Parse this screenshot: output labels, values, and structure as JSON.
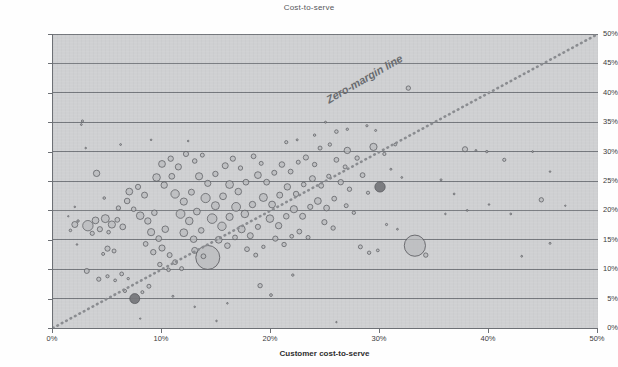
{
  "chart_data": {
    "type": "scatter",
    "title": "Cost-to-serve",
    "xlabel": "Customer cost-to-serve",
    "ylabel": "Product mix margin",
    "xlim": [
      0,
      50
    ],
    "ylim": [
      0,
      50
    ],
    "x_tick_labels": [
      "0%",
      "10%",
      "20%",
      "30%",
      "40%",
      "50%"
    ],
    "x_tick_values": [
      0,
      10,
      20,
      30,
      40,
      50
    ],
    "y_tick_labels": [
      "0%",
      "5%",
      "10%",
      "15%",
      "20%",
      "25%",
      "30%",
      "35%",
      "40%",
      "45%",
      "50%"
    ],
    "y_tick_values": [
      0,
      5,
      10,
      15,
      20,
      25,
      30,
      35,
      40,
      45,
      50
    ],
    "grid": "horizontal",
    "legend": "none",
    "plot_background": "#cfd0d2",
    "bubble_fill": "#b9babd",
    "bubble_stroke": "#55565a",
    "highlight_fill": "#76777b",
    "gridline_color": "#76797e",
    "annotations": [
      {
        "text": "Zero-margin line",
        "type": "reference-line",
        "line_from": [
          0,
          0
        ],
        "line_to": [
          50,
          50
        ],
        "style": "dotted",
        "color": "#8a8c90"
      }
    ],
    "bubbles": [
      {
        "x": 2.0,
        "y": 17.6,
        "r": 3.0
      },
      {
        "x": 2.3,
        "y": 18.2,
        "r": 1.2
      },
      {
        "x": 1.6,
        "y": 16.6,
        "r": 1.3
      },
      {
        "x": 2.7,
        "y": 35.2,
        "r": 1.1
      },
      {
        "x": 2.6,
        "y": 34.6,
        "r": 0.9
      },
      {
        "x": 3.2,
        "y": 17.4,
        "r": 5.2
      },
      {
        "x": 3.9,
        "y": 18.3,
        "r": 3.4
      },
      {
        "x": 4.3,
        "y": 16.8,
        "r": 2.6
      },
      {
        "x": 3.6,
        "y": 16.1,
        "r": 2.1
      },
      {
        "x": 4.8,
        "y": 18.6,
        "r": 4.0
      },
      {
        "x": 5.4,
        "y": 17.6,
        "r": 3.6
      },
      {
        "x": 5.9,
        "y": 18.4,
        "r": 2.4
      },
      {
        "x": 6.4,
        "y": 17.2,
        "r": 2.9
      },
      {
        "x": 5.1,
        "y": 16.3,
        "r": 1.8
      },
      {
        "x": 4.0,
        "y": 26.3,
        "r": 3.2
      },
      {
        "x": 4.7,
        "y": 22.1,
        "r": 1.3
      },
      {
        "x": 5.0,
        "y": 13.5,
        "r": 2.6
      },
      {
        "x": 5.6,
        "y": 13.1,
        "r": 2.0
      },
      {
        "x": 4.6,
        "y": 12.6,
        "r": 1.5
      },
      {
        "x": 3.1,
        "y": 9.7,
        "r": 2.5
      },
      {
        "x": 4.2,
        "y": 8.3,
        "r": 2.1
      },
      {
        "x": 5.0,
        "y": 8.8,
        "r": 1.6
      },
      {
        "x": 5.7,
        "y": 8.1,
        "r": 1.4
      },
      {
        "x": 6.3,
        "y": 9.2,
        "r": 1.9
      },
      {
        "x": 6.9,
        "y": 8.4,
        "r": 1.2
      },
      {
        "x": 7.5,
        "y": 5.0,
        "r": 5.0,
        "highlight": true
      },
      {
        "x": 6.6,
        "y": 6.3,
        "r": 1.6
      },
      {
        "x": 8.2,
        "y": 6.1,
        "r": 1.5
      },
      {
        "x": 8.8,
        "y": 7.1,
        "r": 2.0
      },
      {
        "x": 6.0,
        "y": 20.4,
        "r": 2.2
      },
      {
        "x": 6.8,
        "y": 21.6,
        "r": 2.8
      },
      {
        "x": 7.4,
        "y": 20.2,
        "r": 2.3
      },
      {
        "x": 7.0,
        "y": 23.2,
        "r": 3.4
      },
      {
        "x": 7.8,
        "y": 24.0,
        "r": 2.6
      },
      {
        "x": 8.4,
        "y": 22.6,
        "r": 3.0
      },
      {
        "x": 8.0,
        "y": 19.1,
        "r": 3.8
      },
      {
        "x": 8.7,
        "y": 18.2,
        "r": 3.2
      },
      {
        "x": 9.3,
        "y": 19.6,
        "r": 2.8
      },
      {
        "x": 9.0,
        "y": 16.3,
        "r": 3.6
      },
      {
        "x": 9.7,
        "y": 15.2,
        "r": 2.9
      },
      {
        "x": 10.3,
        "y": 16.8,
        "r": 3.3
      },
      {
        "x": 8.5,
        "y": 14.3,
        "r": 2.4
      },
      {
        "x": 9.2,
        "y": 12.9,
        "r": 2.7
      },
      {
        "x": 10.0,
        "y": 13.6,
        "r": 3.1
      },
      {
        "x": 10.7,
        "y": 12.4,
        "r": 2.5
      },
      {
        "x": 9.8,
        "y": 10.8,
        "r": 2.2
      },
      {
        "x": 10.6,
        "y": 9.9,
        "r": 1.8
      },
      {
        "x": 11.2,
        "y": 11.2,
        "r": 2.4
      },
      {
        "x": 11.8,
        "y": 10.1,
        "r": 2.0
      },
      {
        "x": 9.5,
        "y": 25.6,
        "r": 3.8
      },
      {
        "x": 10.2,
        "y": 24.3,
        "r": 3.2
      },
      {
        "x": 10.9,
        "y": 25.8,
        "r": 2.9
      },
      {
        "x": 10.0,
        "y": 27.9,
        "r": 3.4
      },
      {
        "x": 10.8,
        "y": 28.8,
        "r": 2.7
      },
      {
        "x": 11.5,
        "y": 27.4,
        "r": 3.1
      },
      {
        "x": 11.2,
        "y": 22.8,
        "r": 4.2
      },
      {
        "x": 12.0,
        "y": 21.5,
        "r": 3.6
      },
      {
        "x": 12.7,
        "y": 23.1,
        "r": 3.0
      },
      {
        "x": 11.7,
        "y": 19.4,
        "r": 4.4
      },
      {
        "x": 12.5,
        "y": 18.2,
        "r": 3.8
      },
      {
        "x": 13.2,
        "y": 19.8,
        "r": 3.4
      },
      {
        "x": 12.0,
        "y": 16.2,
        "r": 3.9
      },
      {
        "x": 12.9,
        "y": 15.1,
        "r": 3.3
      },
      {
        "x": 13.6,
        "y": 16.6,
        "r": 2.8
      },
      {
        "x": 13.0,
        "y": 13.2,
        "r": 3.0
      },
      {
        "x": 13.8,
        "y": 12.2,
        "r": 2.4
      },
      {
        "x": 14.2,
        "y": 12.0,
        "r": 12.0
      },
      {
        "x": 12.2,
        "y": 29.6,
        "r": 2.6
      },
      {
        "x": 13.0,
        "y": 28.4,
        "r": 2.3
      },
      {
        "x": 13.7,
        "y": 29.4,
        "r": 2.0
      },
      {
        "x": 13.4,
        "y": 25.8,
        "r": 3.6
      },
      {
        "x": 14.2,
        "y": 24.6,
        "r": 3.1
      },
      {
        "x": 14.9,
        "y": 26.2,
        "r": 2.7
      },
      {
        "x": 14.0,
        "y": 22.1,
        "r": 4.6
      },
      {
        "x": 14.9,
        "y": 20.8,
        "r": 4.0
      },
      {
        "x": 15.6,
        "y": 22.4,
        "r": 3.4
      },
      {
        "x": 14.6,
        "y": 18.6,
        "r": 4.8
      },
      {
        "x": 15.5,
        "y": 17.3,
        "r": 4.2
      },
      {
        "x": 16.2,
        "y": 18.9,
        "r": 3.6
      },
      {
        "x": 15.2,
        "y": 15.0,
        "r": 3.4
      },
      {
        "x": 16.0,
        "y": 14.0,
        "r": 2.8
      },
      {
        "x": 16.7,
        "y": 15.4,
        "r": 2.4
      },
      {
        "x": 15.8,
        "y": 27.6,
        "r": 3.0
      },
      {
        "x": 16.5,
        "y": 28.8,
        "r": 2.6
      },
      {
        "x": 17.2,
        "y": 27.2,
        "r": 2.2
      },
      {
        "x": 16.2,
        "y": 24.4,
        "r": 3.9
      },
      {
        "x": 17.0,
        "y": 23.2,
        "r": 3.3
      },
      {
        "x": 17.7,
        "y": 24.8,
        "r": 2.9
      },
      {
        "x": 16.8,
        "y": 20.6,
        "r": 4.4
      },
      {
        "x": 17.6,
        "y": 19.4,
        "r": 3.8
      },
      {
        "x": 18.3,
        "y": 21.0,
        "r": 3.2
      },
      {
        "x": 17.3,
        "y": 16.8,
        "r": 3.6
      },
      {
        "x": 18.1,
        "y": 15.7,
        "r": 3.0
      },
      {
        "x": 18.8,
        "y": 17.2,
        "r": 2.6
      },
      {
        "x": 17.8,
        "y": 13.4,
        "r": 2.4
      },
      {
        "x": 18.6,
        "y": 12.4,
        "r": 2.0
      },
      {
        "x": 19.3,
        "y": 13.8,
        "r": 1.7
      },
      {
        "x": 18.4,
        "y": 29.2,
        "r": 2.4
      },
      {
        "x": 19.1,
        "y": 28.0,
        "r": 2.0
      },
      {
        "x": 18.8,
        "y": 26.0,
        "r": 3.4
      },
      {
        "x": 19.6,
        "y": 24.8,
        "r": 2.9
      },
      {
        "x": 20.3,
        "y": 26.4,
        "r": 2.5
      },
      {
        "x": 19.3,
        "y": 22.2,
        "r": 4.0
      },
      {
        "x": 20.1,
        "y": 21.0,
        "r": 3.4
      },
      {
        "x": 20.8,
        "y": 22.6,
        "r": 3.0
      },
      {
        "x": 19.9,
        "y": 18.6,
        "r": 3.8
      },
      {
        "x": 20.7,
        "y": 17.4,
        "r": 3.2
      },
      {
        "x": 21.4,
        "y": 19.0,
        "r": 2.8
      },
      {
        "x": 20.4,
        "y": 15.2,
        "r": 2.6
      },
      {
        "x": 21.2,
        "y": 14.2,
        "r": 2.2
      },
      {
        "x": 21.9,
        "y": 15.6,
        "r": 1.9
      },
      {
        "x": 21.0,
        "y": 27.8,
        "r": 2.8
      },
      {
        "x": 21.8,
        "y": 26.6,
        "r": 2.4
      },
      {
        "x": 22.5,
        "y": 28.2,
        "r": 2.0
      },
      {
        "x": 21.5,
        "y": 24.0,
        "r": 3.2
      },
      {
        "x": 22.3,
        "y": 22.8,
        "r": 2.7
      },
      {
        "x": 23.0,
        "y": 24.4,
        "r": 2.3
      },
      {
        "x": 22.1,
        "y": 20.2,
        "r": 3.6
      },
      {
        "x": 22.9,
        "y": 19.0,
        "r": 3.0
      },
      {
        "x": 23.6,
        "y": 20.6,
        "r": 2.6
      },
      {
        "x": 22.6,
        "y": 16.4,
        "r": 2.4
      },
      {
        "x": 23.4,
        "y": 15.4,
        "r": 2.0
      },
      {
        "x": 23.2,
        "y": 29.0,
        "r": 2.6
      },
      {
        "x": 24.0,
        "y": 27.8,
        "r": 2.2
      },
      {
        "x": 23.8,
        "y": 25.4,
        "r": 3.0
      },
      {
        "x": 24.6,
        "y": 24.2,
        "r": 2.5
      },
      {
        "x": 25.3,
        "y": 25.8,
        "r": 2.1
      },
      {
        "x": 24.3,
        "y": 21.6,
        "r": 3.4
      },
      {
        "x": 25.1,
        "y": 20.4,
        "r": 2.9
      },
      {
        "x": 25.8,
        "y": 22.0,
        "r": 2.4
      },
      {
        "x": 24.9,
        "y": 18.0,
        "r": 2.6
      },
      {
        "x": 25.7,
        "y": 17.0,
        "r": 2.2
      },
      {
        "x": 24.5,
        "y": 30.6,
        "r": 2.0
      },
      {
        "x": 25.4,
        "y": 31.2,
        "r": 1.7
      },
      {
        "x": 26.0,
        "y": 28.6,
        "r": 2.4
      },
      {
        "x": 26.8,
        "y": 27.4,
        "r": 2.0
      },
      {
        "x": 26.4,
        "y": 24.8,
        "r": 2.7
      },
      {
        "x": 27.2,
        "y": 23.6,
        "r": 2.2
      },
      {
        "x": 26.9,
        "y": 20.8,
        "r": 2.0
      },
      {
        "x": 27.6,
        "y": 19.6,
        "r": 1.7
      },
      {
        "x": 27.0,
        "y": 30.2,
        "r": 3.2
      },
      {
        "x": 27.9,
        "y": 28.9,
        "r": 2.2
      },
      {
        "x": 28.4,
        "y": 26.0,
        "r": 2.4
      },
      {
        "x": 28.9,
        "y": 23.0,
        "r": 1.6
      },
      {
        "x": 28.2,
        "y": 13.8,
        "r": 2.0
      },
      {
        "x": 29.0,
        "y": 12.8,
        "r": 1.7
      },
      {
        "x": 29.8,
        "y": 13.2,
        "r": 1.4
      },
      {
        "x": 30.0,
        "y": 24.0,
        "r": 5.2,
        "highlight": true
      },
      {
        "x": 29.4,
        "y": 30.8,
        "r": 3.6
      },
      {
        "x": 30.4,
        "y": 29.6,
        "r": 1.6
      },
      {
        "x": 26.0,
        "y": 33.4,
        "r": 1.8
      },
      {
        "x": 27.0,
        "y": 33.8,
        "r": 1.2
      },
      {
        "x": 28.8,
        "y": 34.4,
        "r": 1.1
      },
      {
        "x": 29.6,
        "y": 33.6,
        "r": 1.0
      },
      {
        "x": 21.4,
        "y": 31.6,
        "r": 1.6
      },
      {
        "x": 22.4,
        "y": 32.0,
        "r": 1.0
      },
      {
        "x": 24.0,
        "y": 32.8,
        "r": 1.2
      },
      {
        "x": 25.0,
        "y": 35.0,
        "r": 1.0
      },
      {
        "x": 31.4,
        "y": 31.2,
        "r": 1.4
      },
      {
        "x": 32.6,
        "y": 40.8,
        "r": 2.2
      },
      {
        "x": 31.0,
        "y": 27.0,
        "r": 1.0
      },
      {
        "x": 32.0,
        "y": 25.6,
        "r": 0.9
      },
      {
        "x": 30.6,
        "y": 17.6,
        "r": 1.1
      },
      {
        "x": 31.6,
        "y": 16.8,
        "r": 0.9
      },
      {
        "x": 33.2,
        "y": 14.0,
        "r": 10.6
      },
      {
        "x": 34.2,
        "y": 12.4,
        "r": 2.2
      },
      {
        "x": 35.6,
        "y": 25.2,
        "r": 1.0
      },
      {
        "x": 36.8,
        "y": 22.8,
        "r": 0.9
      },
      {
        "x": 37.8,
        "y": 30.4,
        "r": 2.6
      },
      {
        "x": 38.8,
        "y": 30.2,
        "r": 0.9
      },
      {
        "x": 39.8,
        "y": 30.0,
        "r": 1.2
      },
      {
        "x": 41.4,
        "y": 28.6,
        "r": 1.6
      },
      {
        "x": 44.0,
        "y": 30.0,
        "r": 0.9
      },
      {
        "x": 45.6,
        "y": 26.6,
        "r": 0.8
      },
      {
        "x": 44.8,
        "y": 21.8,
        "r": 2.2
      },
      {
        "x": 45.6,
        "y": 14.4,
        "r": 1.0
      },
      {
        "x": 42.0,
        "y": 19.4,
        "r": 0.9
      },
      {
        "x": 40.0,
        "y": 21.0,
        "r": 0.8
      },
      {
        "x": 38.0,
        "y": 20.0,
        "r": 0.9
      },
      {
        "x": 36.0,
        "y": 19.4,
        "r": 0.8
      },
      {
        "x": 43.0,
        "y": 12.2,
        "r": 0.9
      },
      {
        "x": 47.0,
        "y": 20.8,
        "r": 0.7
      },
      {
        "x": 19.0,
        "y": 7.2,
        "r": 2.2
      },
      {
        "x": 20.0,
        "y": 5.6,
        "r": 1.4
      },
      {
        "x": 16.0,
        "y": 4.2,
        "r": 0.8
      },
      {
        "x": 22.0,
        "y": 9.0,
        "r": 1.2
      },
      {
        "x": 11.0,
        "y": 5.4,
        "r": 1.0
      },
      {
        "x": 13.0,
        "y": 3.6,
        "r": 0.8
      },
      {
        "x": 2.0,
        "y": 20.6,
        "r": 0.8
      },
      {
        "x": 1.4,
        "y": 19.0,
        "r": 0.7
      },
      {
        "x": 2.2,
        "y": 14.2,
        "r": 0.8
      },
      {
        "x": 3.0,
        "y": 30.6,
        "r": 0.8
      },
      {
        "x": 6.2,
        "y": 31.2,
        "r": 0.9
      },
      {
        "x": 9.0,
        "y": 32.0,
        "r": 0.8
      },
      {
        "x": 12.4,
        "y": 31.8,
        "r": 0.8
      },
      {
        "x": 8.0,
        "y": 1.6,
        "r": 0.7
      },
      {
        "x": 15.0,
        "y": 1.2,
        "r": 0.8
      },
      {
        "x": 26.0,
        "y": 1.0,
        "r": 0.7
      }
    ]
  }
}
